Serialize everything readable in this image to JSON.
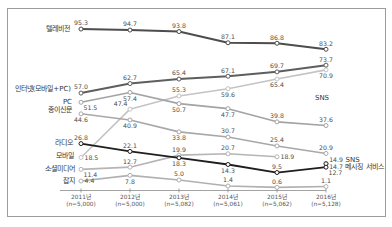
{
  "chart_data": {
    "type": "line",
    "title": "",
    "xlabel": "",
    "ylabel": "",
    "ylim": [
      0,
      100
    ],
    "grid": false,
    "legend_position": "inline-left",
    "categories": [
      "2011년",
      "2012년",
      "2013년",
      "2014년",
      "2015년",
      "2016년"
    ],
    "sample_sizes": [
      "(n=5,000)",
      "(n=5,000)",
      "(n=5,082)",
      "(n=5,061)",
      "(n=5,062)",
      "(n=5,128)"
    ],
    "series": [
      {
        "name": "텔레비전",
        "values": [
          95.3,
          94.7,
          93.8,
          87.1,
          86.8,
          83.2
        ],
        "color": "#4d4d4d"
      },
      {
        "name": "인터넷(모바일+PC)",
        "values": [
          57.0,
          62.7,
          65.4,
          67.1,
          69.7,
          73.7
        ],
        "color": "#5e5e5e"
      },
      {
        "name": "PC",
        "values": [
          51.5,
          57.4,
          50.7,
          47.7,
          39.8,
          37.6
        ],
        "color": "#a3a3a3"
      },
      {
        "name": "모바일",
        "values": [
          18.5,
          47.4,
          55.3,
          59.6,
          65.4,
          70.9
        ],
        "color": "#c4c4c4"
      },
      {
        "name": "종이신문",
        "values": [
          44.6,
          40.9,
          33.8,
          30.7,
          25.4,
          20.9
        ],
        "color": "#a8a8a8"
      },
      {
        "name": "라디오",
        "values": [
          26.8,
          22.1,
          18.3,
          14.3,
          9.5,
          12.7
        ],
        "color": "#1e1e1e"
      },
      {
        "name": "소셜미디어",
        "values": [
          11.4,
          12.7,
          19.9,
          20.7,
          18.9,
          null
        ],
        "color": "#b5b5b5"
      },
      {
        "name": "잡지",
        "values": [
          4.4,
          7.8,
          5.0,
          1.4,
          0.6,
          1.1
        ],
        "color": "#b0b0b0"
      },
      {
        "name": "SNS",
        "values": [
          null,
          null,
          null,
          null,
          null,
          14.9
        ],
        "color": "#8a8a8a"
      },
      {
        "name": "메시징 서비스",
        "values": [
          null,
          null,
          null,
          null,
          null,
          14.7
        ],
        "color": "#333333"
      }
    ],
    "annotations": [
      {
        "text": "SNS"
      }
    ]
  }
}
